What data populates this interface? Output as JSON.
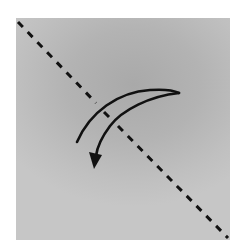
{
  "diagram": {
    "type": "origami-fold-instruction",
    "paper": {
      "shape": "square",
      "fill_top": "#a9a9a9",
      "fill_bottom": "#c6c6c6"
    },
    "fold_line": {
      "style": "dashed",
      "kind": "valley-fold",
      "orientation": "diagonal top-left to bottom-right",
      "color": "#111111"
    },
    "fold_arrow": {
      "style": "curved",
      "direction": "from right edge sweeping down-left across fold line",
      "color": "#111111"
    }
  }
}
